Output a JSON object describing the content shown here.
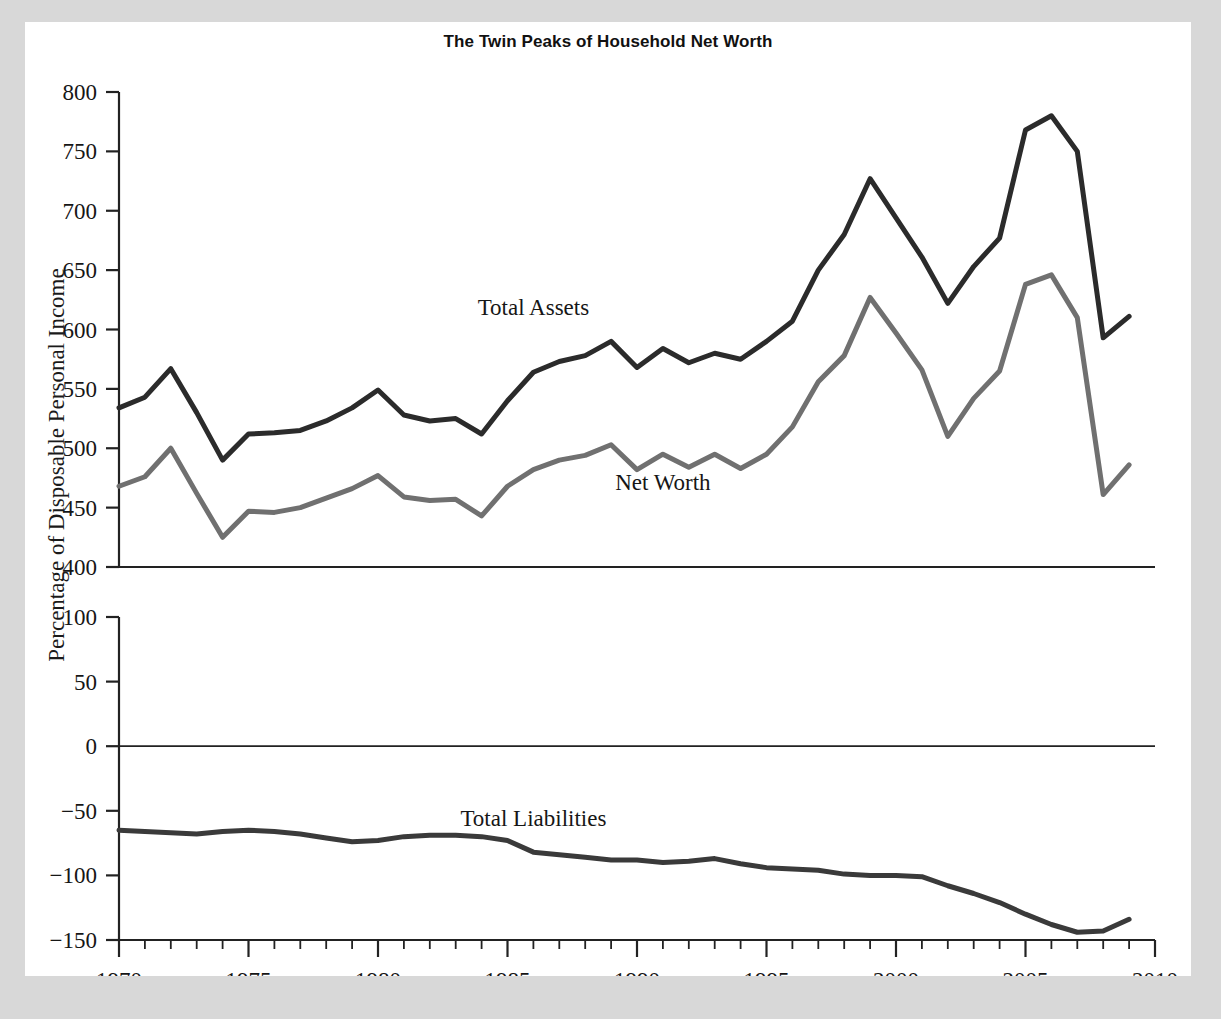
{
  "figure": {
    "title": "The Twin Peaks of Household Net Worth",
    "y_axis_label": "Percentage of Disposable Personal Income"
  },
  "chart_data": {
    "type": "line",
    "title": "The Twin Peaks of Household Net Worth",
    "xlabel": "",
    "ylabel": "Percentage of Disposable Personal Income",
    "grid": false,
    "legend_position": "inline-annotations",
    "panels": [
      {
        "name": "upper-panel",
        "ylim": [
          400,
          800
        ],
        "yticks": [
          400,
          450,
          500,
          550,
          600,
          650,
          700,
          750,
          800
        ],
        "series": [
          {
            "name": "Total Assets",
            "color": "#2b2b2b",
            "label_x": 1986,
            "label_y": 612,
            "x": [
              1970,
              1971,
              1972,
              1973,
              1974,
              1975,
              1976,
              1977,
              1978,
              1979,
              1980,
              1981,
              1982,
              1983,
              1984,
              1985,
              1986,
              1987,
              1988,
              1989,
              1990,
              1991,
              1992,
              1993,
              1994,
              1995,
              1996,
              1997,
              1998,
              1999,
              2000,
              2001,
              2002,
              2003,
              2004,
              2005,
              2006,
              2007,
              2008,
              2009
            ],
            "values": [
              534,
              543,
              567,
              530,
              490,
              512,
              513,
              515,
              523,
              534,
              549,
              528,
              523,
              525,
              512,
              540,
              564,
              573,
              578,
              590,
              568,
              584,
              572,
              580,
              575,
              590,
              607,
              650,
              680,
              727,
              694,
              661,
              622,
              653,
              677,
              768,
              780,
              750,
              593,
              611
            ]
          },
          {
            "name": "Net Worth",
            "color": "#707070",
            "label_x": 1991,
            "label_y": 465,
            "x": [
              1970,
              1971,
              1972,
              1973,
              1974,
              1975,
              1976,
              1977,
              1978,
              1979,
              1980,
              1981,
              1982,
              1983,
              1984,
              1985,
              1986,
              1987,
              1988,
              1989,
              1990,
              1991,
              1992,
              1993,
              1994,
              1995,
              1996,
              1997,
              1998,
              1999,
              2000,
              2001,
              2002,
              2003,
              2004,
              2005,
              2006,
              2007,
              2008,
              2009
            ],
            "values": [
              468,
              476,
              500,
              462,
              425,
              447,
              446,
              450,
              458,
              466,
              477,
              459,
              456,
              457,
              443,
              468,
              482,
              490,
              494,
              503,
              482,
              495,
              484,
              495,
              483,
              495,
              518,
              556,
              578,
              627,
              597,
              566,
              510,
              542,
              565,
              638,
              646,
              610,
              461,
              486
            ]
          }
        ]
      },
      {
        "name": "lower-panel",
        "ylim": [
          -150,
          100
        ],
        "yticks": [
          -150,
          -100,
          -50,
          0,
          50,
          100
        ],
        "zero_line": true,
        "series": [
          {
            "name": "Total Liabilities",
            "color": "#3a3a3a",
            "label_x": 1986,
            "label_y": -62,
            "x": [
              1970,
              1971,
              1972,
              1973,
              1974,
              1975,
              1976,
              1977,
              1978,
              1979,
              1980,
              1981,
              1982,
              1983,
              1984,
              1985,
              1986,
              1987,
              1988,
              1989,
              1990,
              1991,
              1992,
              1993,
              1994,
              1995,
              1996,
              1997,
              1998,
              1999,
              2000,
              2001,
              2002,
              2003,
              2004,
              2005,
              2006,
              2007,
              2008,
              2009
            ],
            "values": [
              -65,
              -66,
              -67,
              -68,
              -66,
              -65,
              -66,
              -68,
              -71,
              -74,
              -73,
              -70,
              -69,
              -69,
              -70,
              -73,
              -82,
              -84,
              -86,
              -88,
              -88,
              -90,
              -89,
              -87,
              -91,
              -94,
              -95,
              -96,
              -99,
              -100,
              -100,
              -101,
              -108,
              -114,
              -121,
              -130,
              -138,
              -144,
              -143,
              -134
            ]
          }
        ]
      }
    ],
    "x": {
      "xlim": [
        1970,
        2010
      ],
      "major_ticks": [
        1970,
        1975,
        1980,
        1985,
        1990,
        1995,
        2000,
        2005,
        2010
      ],
      "minor_tick_step": 1,
      "tick_labels": [
        "1970",
        "1975",
        "1980",
        "1985",
        "1990",
        "1995",
        "2000",
        "2005",
        "2010"
      ]
    }
  }
}
